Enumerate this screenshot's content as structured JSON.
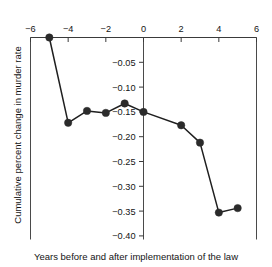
{
  "chart_data": {
    "type": "line",
    "title": "",
    "subtitle": "",
    "xlabel": "Years before and after implementation of the law",
    "ylabel": "Cumulative percent change in murder rate",
    "xlim": [
      -6,
      6
    ],
    "ylim": [
      -0.425,
      0.01
    ],
    "xticks": [
      -6,
      -4,
      -2,
      0,
      2,
      4,
      6
    ],
    "xtick_labels": [
      "−6",
      "−4",
      "−2",
      "0",
      "2",
      "4",
      "6"
    ],
    "yticks": [
      -0.05,
      -0.1,
      -0.15,
      -0.2,
      -0.25,
      -0.3,
      -0.35,
      -0.4
    ],
    "ytick_labels": [
      "−0.05",
      "−0.10",
      "−0.15",
      "−0.20",
      "−0.25",
      "−0.30",
      "−0.35",
      "−0.40"
    ],
    "grid": false,
    "legend": false,
    "x_axis_position": "top",
    "y_axis_position": "center",
    "marker": "filled-circle",
    "marker_color": "#2b2b2b",
    "line_color": "#1f1f1f",
    "series": [
      {
        "name": "Cumulative percent change in murder rate",
        "x": [
          -5,
          -4,
          -3,
          -2,
          -1,
          0,
          2,
          3,
          4,
          5
        ],
        "values": [
          0.0,
          -0.172,
          -0.148,
          -0.152,
          -0.133,
          -0.15,
          -0.177,
          -0.212,
          -0.353,
          -0.344
        ]
      }
    ]
  },
  "axes": {
    "x_axis_title": "Years before and after implementation of the law",
    "y_axis_title": "Cumulative percent change in murder rate"
  }
}
